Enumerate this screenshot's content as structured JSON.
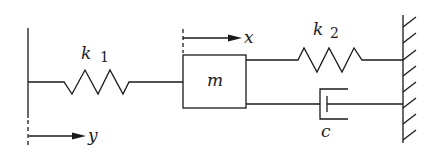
{
  "diagram": {
    "type": "mass-spring-damper system",
    "labels": {
      "spring_left": "k",
      "spring_left_sub": "1",
      "spring_right": "k",
      "spring_right_sub": "2",
      "mass": "m",
      "damper": "c",
      "mass_displacement": "x",
      "base_displacement": "y"
    },
    "components": [
      {
        "id": "left-support",
        "kind": "moving base",
        "displacement": "y"
      },
      {
        "id": "spring-k1",
        "kind": "spring",
        "connects": [
          "left-support",
          "mass"
        ]
      },
      {
        "id": "mass",
        "kind": "mass",
        "displacement": "x"
      },
      {
        "id": "spring-k2",
        "kind": "spring",
        "connects": [
          "mass",
          "fixed-wall"
        ]
      },
      {
        "id": "damper-c",
        "kind": "damper",
        "connects": [
          "mass",
          "fixed-wall"
        ]
      },
      {
        "id": "fixed-wall",
        "kind": "fixed wall (hatched)"
      }
    ],
    "stroke_color": "#1a1a1a"
  }
}
